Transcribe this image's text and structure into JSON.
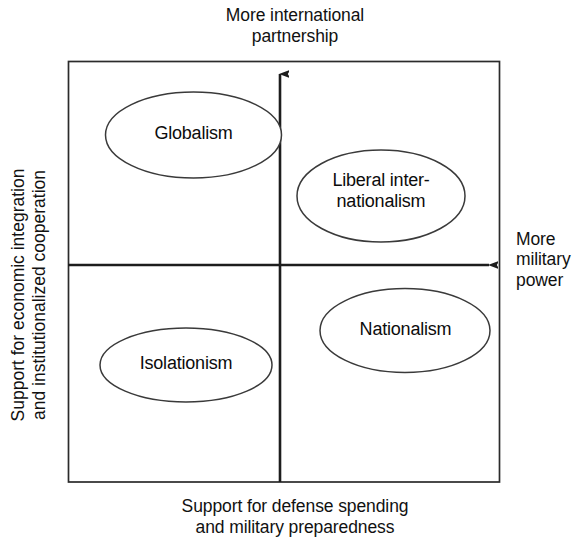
{
  "diagram": {
    "type": "two-by-two-quadrant-matrix",
    "axes": {
      "vertical_top_label": "More international\npartnership",
      "horizontal_right_label": "More\nmilitary\npower",
      "horizontal_bottom_label": "Support for defense spending\nand military preparedness",
      "vertical_left_label": "Support for economic integration\nand institutionalized cooperation"
    },
    "bubbles": [
      {
        "id": "globalism",
        "label": "Globalism",
        "quadrant": "top-left"
      },
      {
        "id": "liberal",
        "label": "Liberal inter-\nnationalism",
        "quadrant": "top-right"
      },
      {
        "id": "isolationism",
        "label": "Isolationism",
        "quadrant": "bottom-left"
      },
      {
        "id": "nationalism",
        "label": "Nationalism",
        "quadrant": "bottom-right"
      }
    ],
    "colors": {
      "stroke": "#2b2b2b",
      "bubble_stroke": "#3a3a3a",
      "bubble_fill": "#ffffff",
      "text": "#111111",
      "background": "#ffffff"
    }
  }
}
